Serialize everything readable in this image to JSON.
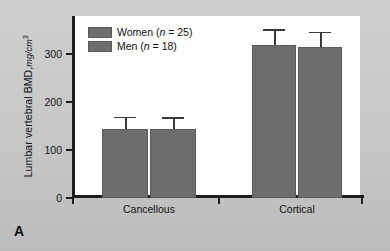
{
  "panel": {
    "label": "A"
  },
  "chart_data": {
    "type": "bar",
    "title": "",
    "xlabel": "",
    "ylabel": "Lumbar vertebral BMD, mg/cm3",
    "ylabel_main": "Lumbar vertebral BMD,",
    "ylabel_unit": "mg/cm",
    "ylabel_unit_exp": "3",
    "categories": [
      "Cancellous",
      "Cortical"
    ],
    "ylim": [
      0,
      380
    ],
    "yticks": [
      0,
      100,
      200,
      300
    ],
    "ytick_labels": [
      "0",
      "100",
      "200",
      "300"
    ],
    "grid": false,
    "legend_position": "top-left",
    "bar_color": "#6d6d6d",
    "error_color": "#3a3a3a",
    "series": [
      {
        "name": "Women",
        "legend_label": "Women (n = 25)",
        "legend_name": "Women",
        "legend_n_prefix": "n",
        "legend_n_value": " = 25",
        "values": [
          145,
          320
        ],
        "errors": [
          25,
          32
        ]
      },
      {
        "name": "Men",
        "legend_label": "Men (n = 18)",
        "legend_name": "Men",
        "legend_n_prefix": "n",
        "legend_n_value": " = 18",
        "values": [
          144,
          316
        ],
        "errors": [
          25,
          31
        ]
      }
    ]
  }
}
